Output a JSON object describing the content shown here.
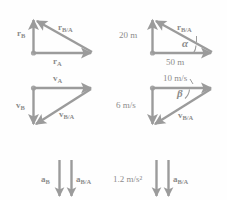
{
  "figure": {
    "stroke_color": "#9b9b9b",
    "text_color": "#8c8c8c",
    "background_color": "#fefefe",
    "panels": [
      {
        "id": "position-generic",
        "labels": {
          "vertical": "r",
          "vertical_sub": "B",
          "horizontal": "r",
          "horizontal_sub": "A",
          "diagonal": "r",
          "diagonal_sub": "B/A"
        }
      },
      {
        "id": "position-values",
        "labels": {
          "vertical": "20 m",
          "horizontal": "50 m",
          "diagonal": "r",
          "diagonal_sub": "B/A",
          "angle": "α"
        }
      },
      {
        "id": "velocity-generic",
        "labels": {
          "horizontal": "v",
          "horizontal_sub": "A",
          "vertical": "v",
          "vertical_sub": "B",
          "diagonal": "v",
          "diagonal_sub": "B/A"
        }
      },
      {
        "id": "velocity-values",
        "labels": {
          "horizontal": "10 m/s",
          "vertical": "6 m/s",
          "diagonal": "v",
          "diagonal_sub": "B/A",
          "angle": "β"
        }
      },
      {
        "id": "acceleration-generic",
        "labels": {
          "left_arrow": "a",
          "left_arrow_sub": "B",
          "right_arrow": "a",
          "right_arrow_sub": "B/A"
        }
      },
      {
        "id": "acceleration-values",
        "labels": {
          "left_arrow": "1.2 m/s²",
          "right_arrow": "a",
          "right_arrow_sub": "B/A"
        }
      }
    ]
  }
}
